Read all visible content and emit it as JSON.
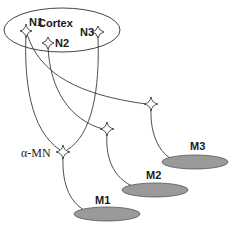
{
  "diagram": {
    "type": "neural-pathway-schematic",
    "region": {
      "label": "Cortex"
    },
    "cortical_neurons": [
      {
        "id": "N1",
        "label": "N1"
      },
      {
        "id": "N2",
        "label": "N2"
      },
      {
        "id": "N3",
        "label": "N3"
      }
    ],
    "motor_neuron": {
      "label": "α-MN"
    },
    "muscles": [
      {
        "id": "M1",
        "label": "M1"
      },
      {
        "id": "M2",
        "label": "M2"
      },
      {
        "id": "M3",
        "label": "M3"
      }
    ],
    "connections": [
      {
        "from": "N1",
        "to": "α-MN"
      },
      {
        "from": "N3",
        "to": "α-MN"
      },
      {
        "from": "N1",
        "to": "interneuron-M3"
      },
      {
        "from": "N2",
        "to": "interneuron-M2"
      },
      {
        "from": "α-MN",
        "to": "M1"
      },
      {
        "from": "interneuron-M2",
        "to": "M2"
      },
      {
        "from": "interneuron-M3",
        "to": "M3"
      }
    ],
    "colors": {
      "line": "#3a3a3a",
      "muscle_fill": "#9a9a9a",
      "background": "#ffffff"
    }
  }
}
